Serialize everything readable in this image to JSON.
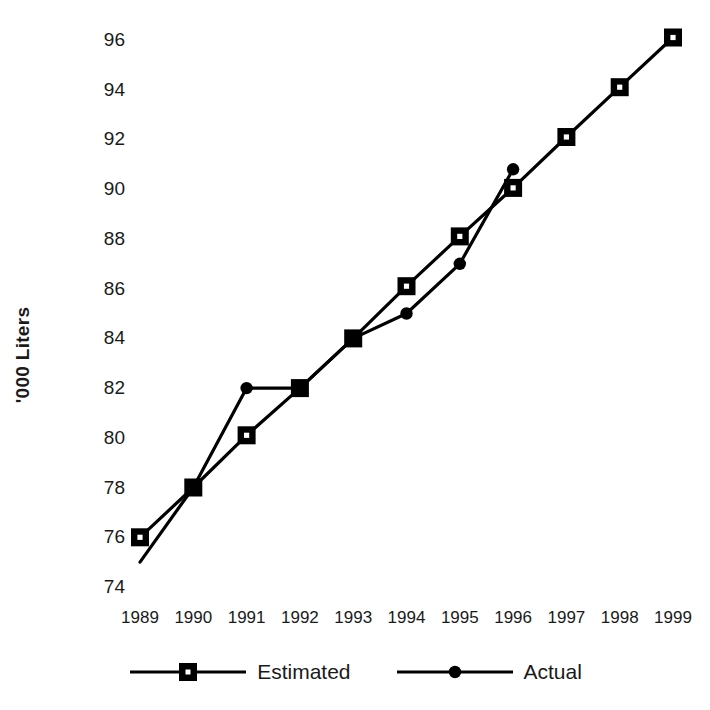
{
  "chart_data": {
    "type": "line",
    "title": "",
    "xlabel": "",
    "ylabel": "'000 Liters",
    "categories": [
      "1989",
      "1990",
      "1991",
      "1992",
      "1993",
      "1994",
      "1995",
      "1996",
      "1997",
      "1998",
      "1999"
    ],
    "x_tick_labels": [
      "1989",
      "1990",
      "1991",
      "1992",
      "1993",
      "1994",
      "1995",
      "1996",
      "1997",
      "1998",
      "1999"
    ],
    "y_tick_labels": [
      "96",
      "94",
      "92",
      "90",
      "88",
      "86",
      "84",
      "82",
      "80",
      "78",
      "76",
      "74"
    ],
    "y_ticks": [
      96,
      94,
      92,
      90,
      88,
      86,
      84,
      82,
      80,
      78,
      76,
      74
    ],
    "ylim": [
      74,
      96.8
    ],
    "grid": false,
    "legend_position": "bottom",
    "series": [
      {
        "name": "Estimated",
        "marker": "square",
        "color": "#000000",
        "x": [
          "1989",
          "1990",
          "1991",
          "1992",
          "1993",
          "1994",
          "1995",
          "1996",
          "1997",
          "1998",
          "1999"
        ],
        "values": [
          76,
          78,
          80.1,
          82,
          84,
          86.1,
          88.1,
          90.05,
          92.1,
          94.1,
          96.1
        ]
      },
      {
        "name": "Actual",
        "marker": "circle",
        "color": "#000000",
        "x": [
          "1989",
          "1990",
          "1991",
          "1992",
          "1993",
          "1994",
          "1995",
          "1996"
        ],
        "values": [
          75,
          78,
          82,
          82,
          84,
          85,
          87,
          90.8
        ]
      }
    ]
  },
  "legend": {
    "items": [
      {
        "label": "Estimated",
        "marker": "square"
      },
      {
        "label": "Actual",
        "marker": "circle"
      }
    ]
  },
  "axis": {
    "y_title": "'000 Liters"
  }
}
